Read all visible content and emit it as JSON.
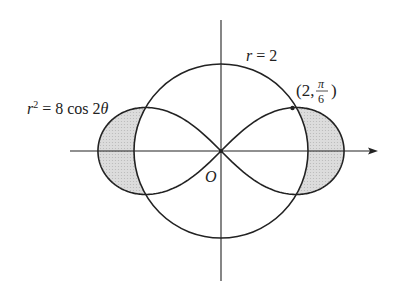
{
  "figure": {
    "type": "polar-diagram",
    "curves": [
      {
        "name": "circle",
        "equation": "r = 2",
        "label_var": "r",
        "label_rest": " = 2"
      },
      {
        "name": "lemniscate",
        "equation": "r^2 = 8 cos 2θ",
        "label_var": "r",
        "label_exp": "2",
        "label_rest": " = 8 cos 2",
        "label_theta": "θ"
      }
    ],
    "intersection_point": {
      "label_open": "(2,",
      "label_num": "π",
      "label_den": "6",
      "label_close": ")"
    },
    "origin_label": "O",
    "shaded_region": "inside lemniscate, outside circle",
    "colors": {
      "stroke": "#222222",
      "shade": "#d6d6d6",
      "background": "#ffffff"
    }
  }
}
